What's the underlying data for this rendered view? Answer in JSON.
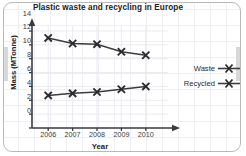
{
  "chart_data": {
    "type": "line",
    "title": "Plastic waste and recycling in Europe",
    "xlabel": "Year",
    "ylabel": "Mass (MTonne)",
    "categories": [
      "2006",
      "2007",
      "2008",
      "2009",
      "2010"
    ],
    "x": [
      2006,
      2007,
      2008,
      2009,
      2010
    ],
    "series": [
      {
        "name": "Waste",
        "values": [
          13.0,
          12.2,
          12.1,
          11.0,
          10.5
        ],
        "marker": "x",
        "color": "#3c3c3c"
      },
      {
        "name": "Recycled",
        "values": [
          4.7,
          5.0,
          5.2,
          5.6,
          6.0
        ],
        "marker": "x",
        "color": "#3c3c3c"
      }
    ],
    "ylim": [
      0,
      15
    ],
    "yticks": [
      0,
      2,
      4,
      6,
      8,
      10,
      12,
      14
    ],
    "xlim": [
      2005.6,
      2010.8
    ],
    "grid": true,
    "legend_position": "right-outside",
    "axis_arrows": true
  },
  "legend": {
    "entries": [
      {
        "label": "Waste"
      },
      {
        "label": "Recycled"
      }
    ]
  },
  "colors": {
    "line": "#3c3c3c",
    "axis": "#3a3a3a",
    "grid": "#e3e6ec",
    "text": "#232323",
    "frame": "#b9b9b9"
  }
}
